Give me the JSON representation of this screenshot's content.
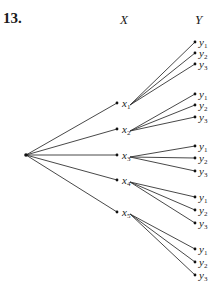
{
  "problem_number": "13.",
  "headers": {
    "x": "X",
    "y": "Y"
  },
  "root": {
    "x": 26,
    "y": 155
  },
  "x_nodes": [
    {
      "label": "x",
      "sub": "1",
      "x": 117,
      "y": 103
    },
    {
      "label": "x",
      "sub": "2",
      "x": 117,
      "y": 129
    },
    {
      "label": "x",
      "sub": "3",
      "x": 117,
      "y": 155
    },
    {
      "label": "x",
      "sub": "4",
      "x": 117,
      "y": 180
    },
    {
      "label": "x",
      "sub": "5",
      "x": 117,
      "y": 212
    }
  ],
  "y_groups": [
    {
      "parent": 0,
      "ys": [
        42,
        53,
        64
      ]
    },
    {
      "parent": 1,
      "ys": [
        94,
        105,
        117
      ]
    },
    {
      "parent": 2,
      "ys": [
        146,
        158,
        171
      ]
    },
    {
      "parent": 3,
      "ys": [
        197,
        210,
        223
      ]
    },
    {
      "parent": 4,
      "ys": [
        249,
        262,
        275
      ]
    }
  ],
  "y_labels": [
    {
      "label": "y",
      "sub": "1"
    },
    {
      "label": "y",
      "sub": "2"
    },
    {
      "label": "y",
      "sub": "3"
    }
  ],
  "y_node_x": 195
}
